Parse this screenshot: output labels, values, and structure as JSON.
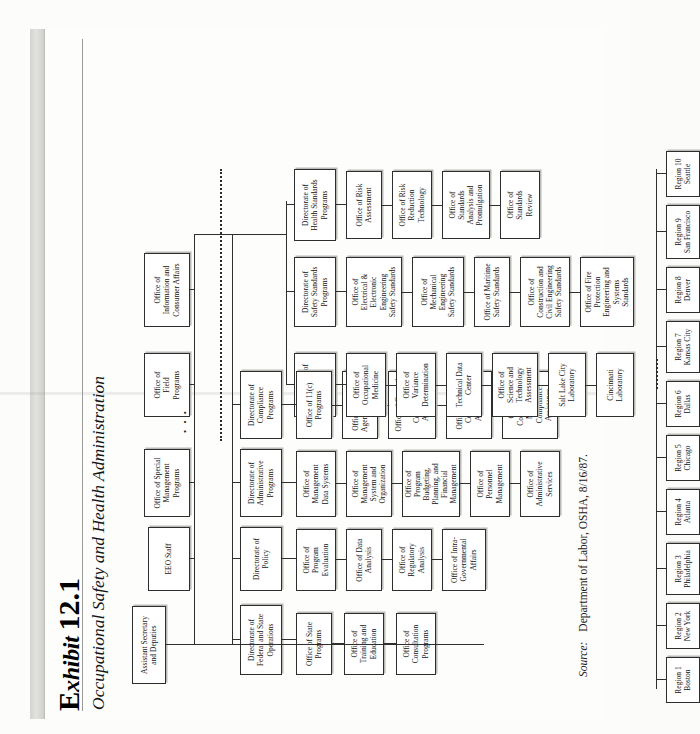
{
  "exhibit": {
    "kicker_prefix": "E",
    "kicker_rest": "xhibit",
    "number": "12.1",
    "title": "Occupational Safety and Health Administration"
  },
  "source": {
    "label": "Source:",
    "text": "Department of Labor, OSHA, 8/16/87."
  },
  "chart_data": {
    "type": "org-chart",
    "title": "Occupational Safety and Health Administration",
    "root": "Assistant Secretary and Deputies",
    "levels": [
      "Assistant Secretary",
      "Staff Offices",
      "Directorates",
      "Offices",
      "Regions"
    ]
  },
  "nodes": {
    "root": "Assistant Secretary\nand Deputies",
    "staff": [
      "EEO Staff",
      "Office of Special\nManagement\nPrograms",
      "Office of\nField\nPrograms",
      "Office of\nInformation and\nConsumer Affairs"
    ],
    "directorates": [
      "Directorate of\nFederal and State\nOperations",
      "Directorate of\nPolicy",
      "Directorate of\nAdministrative\nPrograms",
      "Directorate of\nCompliance\nPrograms",
      "Directorate of\nTechnical\nSupport",
      "Directorate of\nSafety Standards\nPrograms",
      "Directorate of\nHealth Standards\nPrograms"
    ],
    "federal_state_offices": [
      "Office of State\nPrograms",
      "Office of\nTraining and\nEducation",
      "Office of\nConsultation\nPrograms"
    ],
    "policy_offices": [
      "Office of\nProgram\nEvaluation",
      "Office of Data\nAnalysis",
      "Office of\nRegulatory\nAnalysis",
      "Office of Intra-\nGovernmental\nAffairs"
    ],
    "administrative_offices": [
      "Office of\nManagement\nData Systems",
      "Office of\nManagement\nSystem and\nOrganization",
      "Office of\nProgram\nBudgeting,\nPlanning, and\nFinancial\nManagement",
      "Office of\nPersonnel\nManagement",
      "Office of\nAdministrative\nServices"
    ],
    "compliance_offices": [
      "Office of 11(c)\nPrograms",
      "Office of Federal\nAgency Programs",
      "Office of General\nIndustry\nCompliance\nAssistance",
      "Office of Health\nCompliance\nAssistance",
      "Office of\nConstruction-\nMaritime\nCompliance\nAssistance"
    ],
    "technical_offices": [
      "Office of\nOccupational\nMedicine",
      "Office of\nVariance\nDetermination",
      "Technical Data\nCenter",
      "Office of\nScience and\nTechnology\nAssessment",
      "Salt Lake City\nLaboratory",
      "Cincinnati\nLaboratory"
    ],
    "safety_offices": [
      "Office of\nElectrical &\nElectronic\nEngineering\nSafety Standards",
      "Office of\nMechanical\nEngineering\nSafety Standards",
      "Office of Maritime\nSafety Standards",
      "Office of\nConstruction and\nCivil Engineering\nSafety Standards",
      "Office of Fire\nProtection\nEngineering and\nSystems\nStandards"
    ],
    "health_offices": [
      "Office of Risk\nAssessment",
      "Office of Risk\nReduction\nTechnology",
      "Office of\nStandards\nAnalysis and\nPromulgation",
      "Office of\nStandards\nReview"
    ],
    "regions": [
      "Region 1\nBoston",
      "Region 2\nNew York",
      "Region 3\nPhiladelphia",
      "Region 4\nAtlanta",
      "Region 5\nChicago",
      "Region 6\nDallas",
      "Region 7\nKansas City",
      "Region 8\nDenver",
      "Region 9\nSan Francisco",
      "Region 10\nSeattle"
    ],
    "ellipsis_marks": "• • •"
  }
}
